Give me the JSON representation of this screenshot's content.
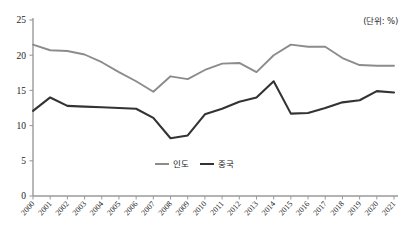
{
  "chart_data": {
    "type": "line",
    "title": "",
    "subtitle": "",
    "unit_note": "(단위: %)",
    "xlabel": "",
    "ylabel": "",
    "ylim": [
      0,
      25
    ],
    "yticks": [
      0,
      5,
      10,
      15,
      20,
      25
    ],
    "grid": false,
    "legend_position": "bottom-center",
    "categories": [
      "2000",
      "2001",
      "2002",
      "2003",
      "2004",
      "2005",
      "2006",
      "2007",
      "2008",
      "2009",
      "2010",
      "2011",
      "2012",
      "2013",
      "2014",
      "2015",
      "2016",
      "2017",
      "2018",
      "2019",
      "2020",
      "2021"
    ],
    "series": [
      {
        "name": "인도",
        "color": "#8c8c8c",
        "values": [
          21.5,
          20.7,
          20.6,
          20.1,
          19.0,
          17.6,
          16.3,
          14.8,
          17.0,
          16.6,
          17.9,
          18.8,
          18.9,
          17.6,
          20.0,
          21.5,
          21.2,
          21.2,
          19.6,
          18.6,
          18.5,
          18.5
        ]
      },
      {
        "name": "중국",
        "color": "#333333",
        "values": [
          12.1,
          14.0,
          12.8,
          12.7,
          12.6,
          12.5,
          12.4,
          11.1,
          8.2,
          8.6,
          11.6,
          12.4,
          13.4,
          14.0,
          16.3,
          11.7,
          11.8,
          12.5,
          13.3,
          13.6,
          14.9,
          14.7
        ]
      }
    ]
  },
  "legend": {
    "items": [
      {
        "label": "인도",
        "color": "#8c8c8c"
      },
      {
        "label": "중국",
        "color": "#333333"
      }
    ]
  },
  "axis": {
    "y_tick_labels": [
      "25",
      "20",
      "15",
      "10",
      "5",
      "0"
    ],
    "x_tick_labels": [
      "2000",
      "2001",
      "2002",
      "2003",
      "2004",
      "2005",
      "2006",
      "2007",
      "2008",
      "2009",
      "2010",
      "2011",
      "2012",
      "2013",
      "2014",
      "2015",
      "2016",
      "2017",
      "2018",
      "2019",
      "2020",
      "2021"
    ]
  }
}
